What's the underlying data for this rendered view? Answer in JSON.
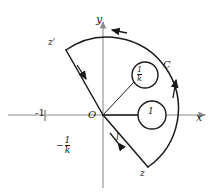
{
  "figure": {
    "type": "complex-plane-contour-diagram",
    "background": "#ffffff",
    "stroke_color": "#1a1a1a",
    "axis_color": "#8c8c8c",
    "axes": {
      "x_label": "x",
      "y_label": "y",
      "origin_label": "O",
      "x_tick_label": "-1"
    },
    "contour": {
      "arc_label": "C",
      "ray_label": "l",
      "start_point_label": "z",
      "end_point_label": "z'",
      "orientation": "counterclockwise"
    },
    "poles": [
      {
        "label_num": "1",
        "label_den": "k",
        "kind": "fraction",
        "name": "pole-one-over-k"
      },
      {
        "label_num": "1",
        "label_den": "",
        "kind": "plain",
        "name": "pole-one"
      }
    ],
    "annotations": {
      "neg_one_over_k_minus": "−",
      "neg_one_over_k_num": "1",
      "neg_one_over_k_den": "k"
    }
  }
}
